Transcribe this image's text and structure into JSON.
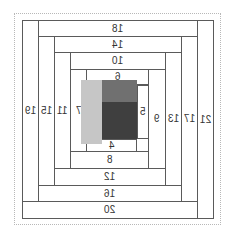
{
  "diagram": {
    "cells": [
      {
        "id": "c21",
        "label": "21",
        "x": 197,
        "y": 20,
        "w": 17,
        "h": 199
      },
      {
        "id": "c20",
        "label": "20",
        "x": 22,
        "y": 201,
        "w": 176,
        "h": 18
      },
      {
        "id": "c19",
        "label": "19",
        "x": 22,
        "y": 20,
        "w": 17,
        "h": 182
      },
      {
        "id": "c18",
        "label": "18",
        "x": 38,
        "y": 20,
        "w": 160,
        "h": 17
      },
      {
        "id": "c17",
        "label": "17",
        "x": 181,
        "y": 36,
        "w": 17,
        "h": 166
      },
      {
        "id": "c16",
        "label": "16",
        "x": 38,
        "y": 185,
        "w": 144,
        "h": 17
      },
      {
        "id": "c15",
        "label": "15",
        "x": 38,
        "y": 36,
        "w": 17,
        "h": 150
      },
      {
        "id": "c14",
        "label": "14",
        "x": 54,
        "y": 36,
        "w": 128,
        "h": 17
      },
      {
        "id": "c13",
        "label": "13",
        "x": 165,
        "y": 52,
        "w": 17,
        "h": 134
      },
      {
        "id": "c12",
        "label": "12",
        "x": 54,
        "y": 168,
        "w": 112,
        "h": 18
      },
      {
        "id": "c11",
        "label": "11",
        "x": 54,
        "y": 52,
        "w": 17,
        "h": 117
      },
      {
        "id": "c10",
        "label": "10",
        "x": 70,
        "y": 52,
        "w": 96,
        "h": 18
      },
      {
        "id": "c9",
        "label": "9",
        "x": 148,
        "y": 69,
        "w": 18,
        "h": 100
      },
      {
        "id": "c8",
        "label": "8",
        "x": 70,
        "y": 151,
        "w": 79,
        "h": 18
      },
      {
        "id": "c7",
        "label": "7",
        "x": 70,
        "y": 69,
        "w": 17,
        "h": 83
      },
      {
        "id": "c6",
        "label": "6",
        "x": 86,
        "y": 69,
        "w": 63,
        "h": 16
      },
      {
        "id": "c5",
        "label": "5",
        "x": 137,
        "y": 85,
        "w": 12,
        "h": 54
      },
      {
        "id": "c4",
        "label": "4",
        "x": 86,
        "y": 139,
        "w": 51,
        "h": 13
      }
    ],
    "blocks": [
      {
        "id": "light",
        "x": 81,
        "y": 80,
        "w": 21,
        "h": 64,
        "color": "#c6c6c6"
      },
      {
        "id": "medium",
        "x": 102,
        "y": 80,
        "w": 35,
        "h": 22,
        "color": "#707070"
      },
      {
        "id": "dark",
        "x": 102,
        "y": 102,
        "w": 35,
        "h": 37,
        "color": "#3f3f3f"
      }
    ]
  }
}
